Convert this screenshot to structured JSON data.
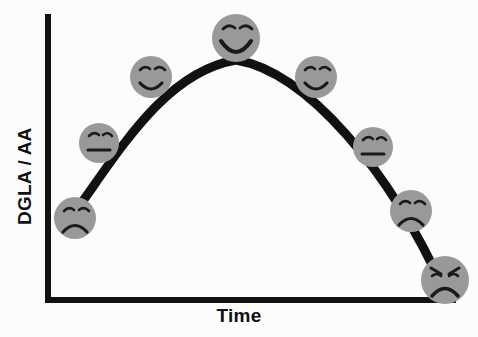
{
  "figure": {
    "background_color": "#fcfcfc",
    "axis_color": "#111111",
    "curve_color": "#111111",
    "face_fill_color": "#999999",
    "face_feature_color": "#1a1a1a"
  },
  "axes": {
    "y_label": "DGLA / AA",
    "x_label": "Time",
    "y_axis_name": "y-axis-line",
    "x_axis_name": "x-axis-line"
  },
  "chart_data": {
    "type": "line",
    "title": "",
    "subtitle": "",
    "xlabel": "Time",
    "ylabel": "DGLA / AA",
    "grid": false,
    "legend": "none",
    "xlim": [
      0,
      10
    ],
    "ylim": [
      0,
      10
    ],
    "annotation": "Inverted-U (parabolic) relationship between DGLA / AA ratio and Time, annotated with mood faces from sad at low ratio, through neutral, to happy at the peak, then back through neutral, sad and angry as the ratio falls.",
    "series": [
      {
        "name": "DGLA / AA over time",
        "x": [
          0.8,
          1.9,
          3.1,
          4.6,
          6.1,
          7.3,
          8.3,
          9.2
        ],
        "y": [
          2.4,
          5.2,
          7.4,
          8.8,
          7.6,
          5.6,
          3.3,
          0.6
        ]
      }
    ],
    "markers": [
      {
        "index": 0,
        "mood": "sad",
        "x_px": 75,
        "y_px": 218,
        "radius_px": 21,
        "label": "sad-face"
      },
      {
        "index": 1,
        "mood": "neutral",
        "x_px": 99,
        "y_px": 143,
        "radius_px": 20,
        "label": "neutral-face"
      },
      {
        "index": 2,
        "mood": "slight-smile",
        "x_px": 151,
        "y_px": 77,
        "radius_px": 21,
        "label": "slight-smile-face"
      },
      {
        "index": 3,
        "mood": "big-smile",
        "x_px": 236,
        "y_px": 38,
        "radius_px": 24,
        "label": "big-smile-face"
      },
      {
        "index": 4,
        "mood": "slight-smile",
        "x_px": 316,
        "y_px": 77,
        "radius_px": 21,
        "label": "slight-smile-face"
      },
      {
        "index": 5,
        "mood": "neutral",
        "x_px": 373,
        "y_px": 147,
        "radius_px": 20,
        "label": "neutral-face"
      },
      {
        "index": 6,
        "mood": "sad",
        "x_px": 411,
        "y_px": 211,
        "radius_px": 21,
        "label": "sad-face"
      },
      {
        "index": 7,
        "mood": "angry",
        "x_px": 445,
        "y_px": 280,
        "radius_px": 24,
        "label": "angry-face"
      }
    ],
    "curve_path": "M 75,212 C 120,150 165,72 236,60 C 307,72 390,170 445,292"
  }
}
